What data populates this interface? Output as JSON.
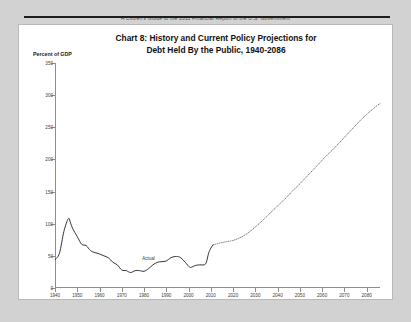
{
  "document": {
    "running_header": "A Citizen's Guide to the 2011 Financial Report of the U.S. Government"
  },
  "chart_panel": {
    "title_line_1": "Chart 8:  History and Current Policy Projections for",
    "title_line_2": "Debt Held By the Public, 1940-2086",
    "unit_label": "Percent of GDP"
  },
  "chart_data": {
    "type": "line",
    "title": "Chart 8:  History and Current Policy Projections for Debt Held By the Public, 1940-2086",
    "xlabel": "",
    "ylabel": "Percent of GDP",
    "xlim": [
      1940,
      2086
    ],
    "ylim": [
      0,
      350
    ],
    "ytick_values": [
      0,
      50,
      100,
      150,
      200,
      250,
      300,
      350
    ],
    "xtick_values": [
      1940,
      1950,
      1960,
      1970,
      1980,
      1990,
      2000,
      2010,
      2020,
      2030,
      2040,
      2050,
      2060,
      2070,
      2080
    ],
    "grid": false,
    "legend": "none",
    "annotations": [
      {
        "text": "Actual",
        "x": 1982,
        "y": 47
      }
    ],
    "series": [
      {
        "name": "Actual",
        "style": "solid",
        "color": "#2a2a2a",
        "x": [
          1940,
          1942,
          1944,
          1946,
          1947,
          1948,
          1950,
          1952,
          1954,
          1956,
          1958,
          1960,
          1962,
          1964,
          1966,
          1968,
          1970,
          1972,
          1974,
          1976,
          1978,
          1980,
          1982,
          1984,
          1986,
          1988,
          1990,
          1992,
          1994,
          1996,
          1998,
          2000,
          2001,
          2003,
          2005,
          2007,
          2008,
          2009,
          2010,
          2011
        ],
        "y": [
          44,
          54,
          88,
          108,
          101,
          92,
          80,
          68,
          66,
          58,
          55,
          53,
          50,
          47,
          40,
          36,
          28,
          27,
          24,
          27,
          27,
          26,
          30,
          36,
          40,
          41,
          42,
          47,
          49,
          48,
          42,
          34,
          32,
          35,
          36,
          36,
          40,
          54,
          62,
          67
        ]
      },
      {
        "name": "Current Policy Projection",
        "style": "dotted",
        "color": "#5a5a5a",
        "x": [
          2011,
          2014,
          2017,
          2020,
          2023,
          2026,
          2029,
          2032,
          2035,
          2038,
          2041,
          2044,
          2047,
          2050,
          2053,
          2056,
          2059,
          2062,
          2065,
          2068,
          2071,
          2074,
          2077,
          2080,
          2083,
          2086
        ],
        "y": [
          67,
          70,
          72,
          74,
          78,
          84,
          92,
          101,
          111,
          121,
          131,
          141,
          152,
          162,
          173,
          184,
          195,
          206,
          216,
          227,
          238,
          249,
          260,
          270,
          279,
          287
        ]
      }
    ]
  }
}
